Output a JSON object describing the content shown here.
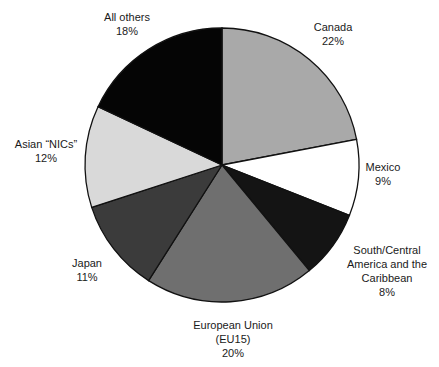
{
  "chart_data": {
    "type": "pie",
    "title": "",
    "start_angle_deg": 0,
    "direction": "clockwise",
    "center": [
      222,
      165
    ],
    "radius": 137,
    "slices": [
      {
        "label": "Canada",
        "value": 22,
        "value_label": "22%",
        "color": "#a9a9a9",
        "label_lines": [
          "Canada",
          "22%"
        ],
        "label_pos": [
          333,
          20
        ]
      },
      {
        "label": "Mexico",
        "value": 9,
        "value_label": "9%",
        "color": "#ffffff",
        "label_lines": [
          "Mexico",
          "9%"
        ],
        "label_pos": [
          383,
          160
        ]
      },
      {
        "label": "South/Central America and the Caribbean",
        "value": 8,
        "value_label": "8%",
        "color": "#141414",
        "label_lines": [
          "South/Central",
          "America and the",
          "Caribbean",
          "8%"
        ],
        "label_pos": [
          387,
          243
        ]
      },
      {
        "label": "European Union (EU15)",
        "value": 20,
        "value_label": "20%",
        "color": "#6f6f6f",
        "label_lines": [
          "European Union",
          "(EU15)",
          "20%"
        ],
        "label_pos": [
          233,
          318
        ]
      },
      {
        "label": "Japan",
        "value": 11,
        "value_label": "11%",
        "color": "#3b3b3b",
        "label_lines": [
          "Japan",
          "11%"
        ],
        "label_pos": [
          87,
          256
        ]
      },
      {
        "label": "Asian “NICs”",
        "value": 12,
        "value_label": "12%",
        "color": "#d9d9d9",
        "label_lines": [
          "Asian “NICs”",
          "12%"
        ],
        "label_pos": [
          46,
          137
        ]
      },
      {
        "label": "All others",
        "value": 18,
        "value_label": "18%",
        "color": "#050505",
        "label_lines": [
          "All others",
          "18%"
        ],
        "label_pos": [
          127,
          10
        ]
      }
    ],
    "legend": "none",
    "grid": false
  }
}
